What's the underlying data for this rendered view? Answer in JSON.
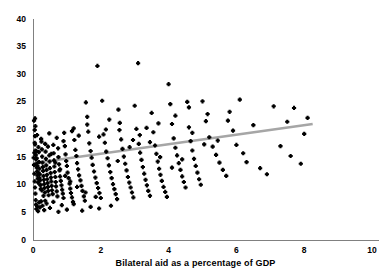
{
  "chart_data": {
    "type": "scatter",
    "title": "",
    "xlabel": "Bilateral aid as a percentage of GDP",
    "ylabel": "",
    "xlim": [
      0,
      10
    ],
    "ylim": [
      0,
      40
    ],
    "xticks": [
      "0",
      "2",
      "4",
      "6",
      "8",
      "10"
    ],
    "yticks": [
      "0",
      "5",
      "10",
      "15",
      "20",
      "25",
      "30",
      "35",
      "40"
    ],
    "grid": false,
    "legend": null,
    "marker_color": "#000000",
    "trendline": {
      "color": "#a6a6a6",
      "x": [
        0.0,
        8.25
      ],
      "y": [
        13.9,
        21.0
      ]
    },
    "points": [
      [
        0.03,
        21.6
      ],
      [
        0.05,
        19.9
      ],
      [
        0.06,
        17.3
      ],
      [
        0.07,
        16.2
      ],
      [
        0.08,
        15.4
      ],
      [
        0.09,
        14.6
      ],
      [
        0.1,
        13.8
      ],
      [
        0.11,
        13.1
      ],
      [
        0.12,
        12.4
      ],
      [
        0.13,
        11.7
      ],
      [
        0.14,
        11.1
      ],
      [
        0.15,
        10.4
      ],
      [
        0.16,
        16.8
      ],
      [
        0.17,
        15.9
      ],
      [
        0.18,
        14.1
      ],
      [
        0.19,
        12.9
      ],
      [
        0.2,
        11.9
      ],
      [
        0.21,
        10.8
      ],
      [
        0.22,
        9.9
      ],
      [
        0.23,
        9.2
      ],
      [
        0.25,
        17.8
      ],
      [
        0.26,
        16.4
      ],
      [
        0.27,
        15.1
      ],
      [
        0.28,
        14.0
      ],
      [
        0.29,
        13.2
      ],
      [
        0.3,
        12.5
      ],
      [
        0.31,
        11.6
      ],
      [
        0.32,
        10.9
      ],
      [
        0.33,
        10.1
      ],
      [
        0.34,
        9.4
      ],
      [
        0.35,
        8.6
      ],
      [
        0.37,
        16.0
      ],
      [
        0.38,
        14.7
      ],
      [
        0.39,
        13.5
      ],
      [
        0.4,
        12.7
      ],
      [
        0.41,
        11.8
      ],
      [
        0.42,
        11.0
      ],
      [
        0.43,
        10.3
      ],
      [
        0.44,
        9.6
      ],
      [
        0.45,
        8.9
      ],
      [
        0.46,
        8.1
      ],
      [
        0.48,
        15.3
      ],
      [
        0.49,
        14.2
      ],
      [
        0.5,
        13.0
      ],
      [
        0.52,
        12.1
      ],
      [
        0.53,
        11.3
      ],
      [
        0.54,
        10.6
      ],
      [
        0.55,
        9.8
      ],
      [
        0.56,
        9.0
      ],
      [
        0.58,
        8.3
      ],
      [
        0.6,
        17.2
      ],
      [
        0.61,
        15.7
      ],
      [
        0.62,
        14.4
      ],
      [
        0.63,
        13.3
      ],
      [
        0.64,
        12.3
      ],
      [
        0.66,
        11.4
      ],
      [
        0.67,
        10.5
      ],
      [
        0.68,
        9.7
      ],
      [
        0.7,
        8.8
      ],
      [
        0.72,
        7.9
      ],
      [
        0.74,
        16.6
      ],
      [
        0.75,
        15.0
      ],
      [
        0.77,
        13.7
      ],
      [
        0.78,
        12.6
      ],
      [
        0.8,
        11.5
      ],
      [
        0.82,
        10.7
      ],
      [
        0.84,
        9.9
      ],
      [
        0.86,
        9.1
      ],
      [
        0.88,
        8.4
      ],
      [
        0.9,
        7.6
      ],
      [
        0.92,
        19.4
      ],
      [
        0.94,
        17.0
      ],
      [
        0.96,
        15.5
      ],
      [
        0.98,
        14.3
      ],
      [
        1.0,
        13.4
      ],
      [
        1.02,
        12.2
      ],
      [
        1.05,
        11.2
      ],
      [
        1.08,
        10.2
      ],
      [
        1.1,
        9.3
      ],
      [
        1.12,
        8.5
      ],
      [
        1.15,
        7.7
      ],
      [
        1.18,
        6.9
      ],
      [
        1.2,
        20.2
      ],
      [
        1.22,
        18.1
      ],
      [
        1.25,
        16.3
      ],
      [
        1.28,
        15.2
      ],
      [
        1.3,
        13.9
      ],
      [
        1.33,
        12.8
      ],
      [
        1.36,
        11.7
      ],
      [
        1.4,
        10.8
      ],
      [
        1.43,
        9.8
      ],
      [
        1.46,
        8.9
      ],
      [
        1.5,
        7.9
      ],
      [
        1.53,
        7.1
      ],
      [
        1.56,
        24.9
      ],
      [
        1.6,
        22.3
      ],
      [
        1.63,
        19.6
      ],
      [
        1.66,
        17.5
      ],
      [
        1.7,
        16.1
      ],
      [
        1.73,
        14.9
      ],
      [
        1.76,
        13.6
      ],
      [
        1.8,
        12.4
      ],
      [
        1.84,
        11.3
      ],
      [
        1.88,
        10.3
      ],
      [
        1.92,
        9.4
      ],
      [
        1.9,
        31.5
      ],
      [
        1.96,
        8.5
      ],
      [
        2.0,
        7.6
      ],
      [
        2.04,
        25.2
      ],
      [
        2.08,
        19.1
      ],
      [
        2.12,
        17.6
      ],
      [
        2.16,
        16.0
      ],
      [
        2.2,
        14.8
      ],
      [
        2.24,
        13.5
      ],
      [
        2.28,
        12.3
      ],
      [
        2.32,
        11.2
      ],
      [
        2.36,
        10.1
      ],
      [
        2.4,
        9.2
      ],
      [
        2.44,
        8.3
      ],
      [
        2.48,
        7.4
      ],
      [
        2.52,
        23.6
      ],
      [
        2.56,
        21.2
      ],
      [
        2.6,
        18.2
      ],
      [
        2.64,
        16.5
      ],
      [
        2.68,
        15.1
      ],
      [
        2.72,
        13.8
      ],
      [
        2.76,
        12.6
      ],
      [
        2.8,
        11.4
      ],
      [
        2.84,
        10.4
      ],
      [
        2.88,
        9.5
      ],
      [
        2.92,
        8.6
      ],
      [
        2.96,
        7.7
      ],
      [
        3.0,
        24.3
      ],
      [
        3.05,
        20.1
      ],
      [
        3.1,
        32.0
      ],
      [
        3.12,
        17.4
      ],
      [
        3.16,
        15.8
      ],
      [
        3.2,
        14.5
      ],
      [
        3.24,
        13.2
      ],
      [
        3.28,
        12.0
      ],
      [
        3.32,
        10.9
      ],
      [
        3.36,
        9.9
      ],
      [
        3.4,
        8.9
      ],
      [
        3.45,
        8.0
      ],
      [
        3.5,
        23.0
      ],
      [
        3.55,
        19.5
      ],
      [
        3.6,
        17.1
      ],
      [
        3.64,
        15.6
      ],
      [
        3.68,
        14.2
      ],
      [
        3.72,
        12.9
      ],
      [
        3.76,
        11.8
      ],
      [
        3.8,
        10.7
      ],
      [
        3.85,
        9.6
      ],
      [
        3.9,
        8.7
      ],
      [
        3.95,
        7.8
      ],
      [
        4.0,
        28.2
      ],
      [
        4.05,
        24.6
      ],
      [
        4.1,
        21.0
      ],
      [
        4.15,
        18.4
      ],
      [
        4.2,
        16.7
      ],
      [
        4.25,
        15.3
      ],
      [
        4.3,
        13.9
      ],
      [
        4.35,
        12.7
      ],
      [
        4.4,
        11.5
      ],
      [
        4.45,
        10.5
      ],
      [
        4.5,
        9.5
      ],
      [
        4.55,
        25.0
      ],
      [
        4.6,
        20.4
      ],
      [
        4.65,
        17.9
      ],
      [
        4.7,
        16.2
      ],
      [
        4.75,
        14.7
      ],
      [
        4.8,
        13.4
      ],
      [
        4.85,
        12.2
      ],
      [
        4.9,
        11.0
      ],
      [
        4.95,
        10.0
      ],
      [
        5.0,
        25.1
      ],
      [
        5.1,
        21.5
      ],
      [
        5.2,
        18.6
      ],
      [
        5.3,
        16.9
      ],
      [
        5.4,
        15.4
      ],
      [
        5.5,
        14.0
      ],
      [
        5.6,
        12.7
      ],
      [
        5.7,
        11.6
      ],
      [
        5.8,
        23.2
      ],
      [
        5.9,
        19.8
      ],
      [
        6.0,
        17.2
      ],
      [
        6.1,
        25.4
      ],
      [
        6.2,
        15.7
      ],
      [
        6.3,
        14.1
      ],
      [
        6.5,
        20.8
      ],
      [
        6.7,
        13.0
      ],
      [
        6.9,
        11.9
      ],
      [
        7.1,
        24.2
      ],
      [
        7.3,
        17.0
      ],
      [
        7.5,
        21.4
      ],
      [
        7.6,
        15.2
      ],
      [
        7.7,
        23.9
      ],
      [
        7.9,
        13.8
      ],
      [
        8.0,
        19.2
      ],
      [
        8.1,
        22.1
      ],
      [
        0.04,
        12.0
      ],
      [
        0.05,
        10.6
      ],
      [
        0.06,
        9.5
      ],
      [
        0.07,
        8.4
      ],
      [
        0.08,
        7.2
      ],
      [
        0.09,
        6.4
      ],
      [
        0.1,
        5.6
      ],
      [
        0.12,
        6.1
      ],
      [
        0.15,
        5.2
      ],
      [
        0.18,
        6.8
      ],
      [
        0.2,
        5.9
      ],
      [
        0.24,
        7.0
      ],
      [
        0.28,
        6.2
      ],
      [
        0.33,
        5.4
      ],
      [
        0.4,
        6.6
      ],
      [
        0.5,
        5.8
      ],
      [
        0.6,
        6.9
      ],
      [
        0.75,
        5.1
      ],
      [
        0.85,
        6.3
      ],
      [
        1.0,
        5.5
      ],
      [
        1.2,
        6.5
      ],
      [
        1.45,
        5.3
      ],
      [
        1.7,
        6.0
      ],
      [
        1.95,
        5.7
      ],
      [
        2.3,
        6.2
      ],
      [
        0.02,
        14.9
      ],
      [
        0.03,
        13.6
      ],
      [
        0.04,
        15.8
      ],
      [
        0.05,
        17.6
      ],
      [
        0.06,
        18.8
      ],
      [
        0.07,
        20.6
      ],
      [
        0.09,
        16.1
      ],
      [
        0.11,
        14.8
      ],
      [
        0.13,
        13.4
      ],
      [
        0.16,
        12.2
      ],
      [
        0.19,
        11.2
      ],
      [
        0.22,
        10.0
      ],
      [
        0.26,
        9.0
      ],
      [
        0.31,
        8.0
      ],
      [
        0.36,
        7.1
      ],
      [
        0.44,
        16.9
      ],
      [
        0.54,
        15.6
      ],
      [
        0.66,
        14.0
      ],
      [
        0.8,
        12.8
      ],
      [
        0.95,
        11.6
      ],
      [
        1.1,
        10.6
      ],
      [
        1.3,
        9.6
      ],
      [
        1.55,
        8.6
      ],
      [
        1.85,
        7.8
      ],
      [
        2.15,
        20.0
      ],
      [
        2.5,
        14.3
      ],
      [
        2.85,
        16.8
      ],
      [
        3.15,
        19.0
      ],
      [
        3.45,
        17.7
      ],
      [
        3.75,
        15.0
      ],
      [
        4.1,
        13.1
      ],
      [
        4.4,
        14.6
      ],
      [
        4.7,
        19.4
      ],
      [
        5.05,
        17.3
      ],
      [
        5.45,
        18.0
      ],
      [
        0.06,
        22.0
      ],
      [
        0.12,
        19.0
      ],
      [
        0.24,
        18.3
      ],
      [
        0.36,
        17.4
      ],
      [
        0.48,
        19.3
      ],
      [
        0.7,
        18.5
      ],
      [
        0.9,
        17.9
      ],
      [
        1.15,
        19.7
      ],
      [
        1.35,
        18.9
      ],
      [
        1.6,
        20.9
      ],
      [
        1.95,
        18.7
      ],
      [
        2.25,
        21.8
      ],
      [
        2.55,
        19.9
      ],
      [
        2.95,
        18.1
      ],
      [
        3.35,
        20.3
      ],
      [
        3.7,
        21.1
      ],
      [
        4.2,
        22.5
      ],
      [
        4.6,
        24.0
      ],
      [
        5.15,
        22.8
      ],
      [
        5.75,
        21.6
      ]
    ]
  },
  "axis": {
    "x_tick_values": [
      0,
      2,
      4,
      6,
      8,
      10
    ],
    "y_tick_values": [
      0,
      5,
      10,
      15,
      20,
      25,
      30,
      35,
      40
    ]
  }
}
